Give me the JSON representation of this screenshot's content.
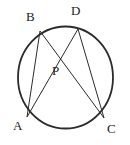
{
  "figure": {
    "type": "circle-geometry-diagram",
    "canvas": {
      "width": 130,
      "height": 145
    },
    "stroke_color": "#2b2b2b",
    "label_color": "#222222",
    "background_color": "#ffffff",
    "circle": {
      "name": "circumcircle",
      "cx": 65.5,
      "cy": 77.5,
      "rx": 47.5,
      "ry": 51.0,
      "stroke_width": 1.8
    },
    "points": [
      {
        "id": "A",
        "label": "A",
        "x": 27.0,
        "y": 117.0,
        "label_x": 13,
        "label_y": 119
      },
      {
        "id": "B",
        "label": "B",
        "x": 40.0,
        "y": 31.0,
        "label_x": 26,
        "label_y": 10
      },
      {
        "id": "C",
        "label": "C",
        "x": 104.0,
        "y": 118.0,
        "label_x": 107,
        "label_y": 122
      },
      {
        "id": "D",
        "label": "D",
        "x": 78.0,
        "y": 29.0,
        "label_x": 71,
        "label_y": 4
      },
      {
        "id": "P",
        "label": "P",
        "x": 60.0,
        "y": 62.0,
        "label_x": 52,
        "label_y": 64
      }
    ],
    "chords": [
      {
        "id": "AB",
        "from": "A",
        "to": "B",
        "stroke_width": 1.0
      },
      {
        "id": "AD",
        "from": "A",
        "to": "D",
        "stroke_width": 1.0
      },
      {
        "id": "BC",
        "from": "B",
        "to": "C",
        "stroke_width": 1.0
      },
      {
        "id": "CD",
        "from": "C",
        "to": "D",
        "stroke_width": 1.0
      }
    ],
    "intersection": {
      "id": "P",
      "of": [
        "AD",
        "BC"
      ]
    }
  }
}
